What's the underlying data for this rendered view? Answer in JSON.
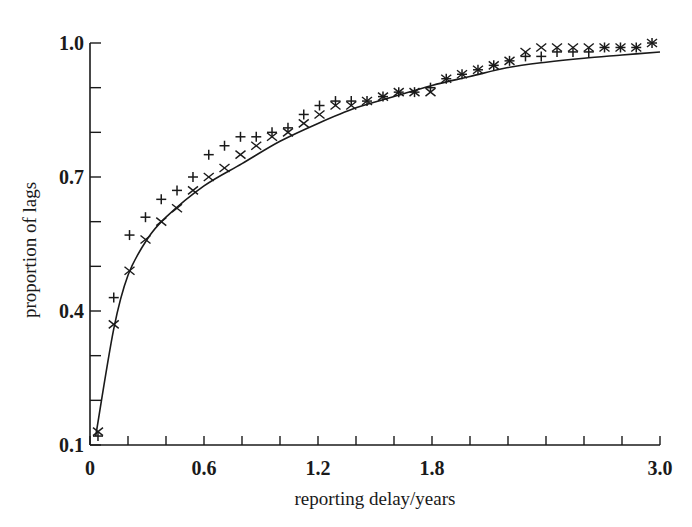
{
  "chart_data": {
    "type": "scatter",
    "title": "",
    "xlabel": "reporting delay/years",
    "ylabel": "proportion of lags",
    "xlim": [
      0,
      3.0
    ],
    "ylim": [
      0.1,
      1.0
    ],
    "grid": false,
    "legend": null,
    "x_ticks": [
      {
        "value": 0,
        "label": "0"
      },
      {
        "value": 0.6,
        "label": "0.6"
      },
      {
        "value": 1.2,
        "label": "1.2"
      },
      {
        "value": 1.8,
        "label": "1.8"
      },
      {
        "value": 3.0,
        "label": "3.0"
      }
    ],
    "x_minor_tick_step": 0.2,
    "y_ticks": [
      {
        "value": 0.1,
        "label": "0.1"
      },
      {
        "value": 0.4,
        "label": "0.4"
      },
      {
        "value": 0.7,
        "label": "0.7"
      },
      {
        "value": 1.0,
        "label": "1.0"
      }
    ],
    "y_minor_tick_step": 0.1,
    "x": [
      0.042,
      0.125,
      0.208,
      0.292,
      0.375,
      0.458,
      0.542,
      0.625,
      0.708,
      0.792,
      0.875,
      0.958,
      1.042,
      1.125,
      1.208,
      1.292,
      1.375,
      1.458,
      1.542,
      1.625,
      1.708,
      1.792,
      1.875,
      1.958,
      2.042,
      2.125,
      2.208,
      2.292,
      2.375,
      2.458,
      2.542,
      2.625,
      2.708,
      2.792,
      2.875,
      2.958
    ],
    "series": [
      {
        "name": "plus",
        "marker": "+",
        "values": [
          0.12,
          0.43,
          0.57,
          0.61,
          0.65,
          0.67,
          0.7,
          0.75,
          0.77,
          0.79,
          0.79,
          0.8,
          0.81,
          0.84,
          0.86,
          0.87,
          0.87,
          0.87,
          0.88,
          0.89,
          0.89,
          0.9,
          0.92,
          0.93,
          0.94,
          0.95,
          0.96,
          0.97,
          0.97,
          0.98,
          0.98,
          0.98,
          0.99,
          0.99,
          0.99,
          1.0
        ]
      },
      {
        "name": "cross",
        "marker": "x",
        "values": [
          0.13,
          0.37,
          0.49,
          0.56,
          0.6,
          0.63,
          0.67,
          0.7,
          0.72,
          0.75,
          0.77,
          0.79,
          0.8,
          0.82,
          0.84,
          0.86,
          0.86,
          0.87,
          0.88,
          0.89,
          0.89,
          0.89,
          0.92,
          0.93,
          0.94,
          0.95,
          0.96,
          0.98,
          0.99,
          0.99,
          0.99,
          0.99,
          0.99,
          0.99,
          0.99,
          1.0
        ]
      },
      {
        "name": "fitted curve",
        "marker": "line",
        "x": [
          0.03,
          0.125,
          0.2,
          0.3,
          0.4,
          0.6,
          0.8,
          1.0,
          1.2,
          1.4,
          1.6,
          1.8,
          2.0,
          2.2,
          2.4,
          2.6,
          2.8,
          3.0
        ],
        "values": [
          0.12,
          0.36,
          0.48,
          0.56,
          0.61,
          0.68,
          0.73,
          0.78,
          0.82,
          0.855,
          0.88,
          0.905,
          0.925,
          0.945,
          0.957,
          0.966,
          0.973,
          0.98
        ]
      }
    ]
  }
}
